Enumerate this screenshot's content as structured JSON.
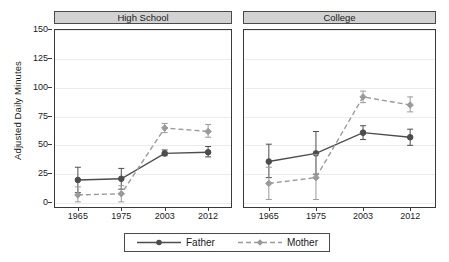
{
  "chart_data": {
    "type": "line",
    "title": "",
    "xlabel": "",
    "ylabel": "Adjusted Daily Minutes",
    "ylim": [
      0,
      150
    ],
    "yticks": [
      0,
      25,
      50,
      75,
      100,
      125,
      150
    ],
    "ytick_labels": [
      "0",
      "25",
      "50",
      "75",
      "100",
      "125",
      "150"
    ],
    "grid": true,
    "legend_position": "bottom-center",
    "categories": [
      "1965",
      "1975",
      "2003",
      "2012"
    ],
    "panels": [
      {
        "label": "High School",
        "series": [
          {
            "name": "Father",
            "values": [
              20,
              21,
              43,
              44
            ],
            "err_low": [
              9,
              12,
              41,
              40
            ],
            "err_high": [
              31,
              30,
              46,
              49
            ],
            "line_style": "solid",
            "color": "#4d4d4d",
            "marker": "circle"
          },
          {
            "name": "Mother",
            "values": [
              7,
              8,
              65,
              62
            ],
            "err_low": [
              1,
              1,
              61,
              57
            ],
            "err_high": [
              14,
              15,
              69,
              68
            ],
            "line_style": "dashed",
            "color": "#9a9a9a",
            "marker": "diamond"
          }
        ]
      },
      {
        "label": "College",
        "series": [
          {
            "name": "Father",
            "values": [
              36,
              43,
              61,
              57
            ],
            "err_low": [
              22,
              25,
              55,
              50
            ],
            "err_high": [
              51,
              62,
              67,
              64
            ],
            "line_style": "solid",
            "color": "#4d4d4d",
            "marker": "circle"
          },
          {
            "name": "Mother",
            "values": [
              17,
              22,
              92,
              85
            ],
            "err_low": [
              3,
              3,
              87,
              79
            ],
            "err_high": [
              31,
              42,
              97,
              92
            ],
            "line_style": "dashed",
            "color": "#9a9a9a",
            "marker": "diamond"
          }
        ]
      }
    ],
    "legend": [
      {
        "label": "Father",
        "line_style": "solid",
        "color": "#4d4d4d",
        "marker": "circle"
      },
      {
        "label": "Mother",
        "line_style": "dashed",
        "color": "#9a9a9a",
        "marker": "diamond"
      }
    ],
    "colors": {
      "father": "#4d4d4d",
      "mother": "#9a9a9a",
      "grid": "#ececec",
      "axis": "#3a3a3a",
      "strip_background": "#d2d2d2",
      "background": "#ffffff"
    }
  }
}
